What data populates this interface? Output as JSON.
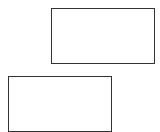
{
  "canvas": {
    "width": 160,
    "height": 132,
    "background": "#ffffff"
  },
  "shapes": [
    {
      "type": "rectangle",
      "x": 51,
      "y": 8,
      "width": 104,
      "height": 56,
      "stroke": "#333333",
      "fill": "#ffffff"
    },
    {
      "type": "rectangle",
      "x": 8,
      "y": 76,
      "width": 104,
      "height": 56,
      "stroke": "#333333",
      "fill": "#ffffff"
    }
  ]
}
